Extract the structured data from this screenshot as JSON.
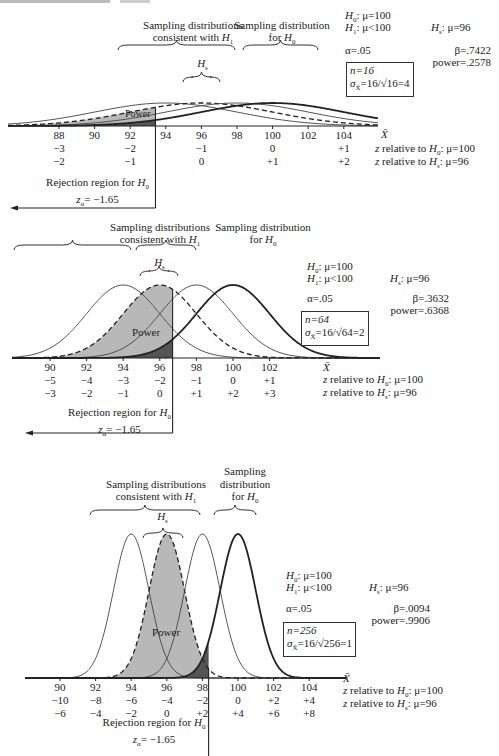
{
  "chart_data": [
    {
      "type": "line",
      "title": "Power for n=16",
      "xlabel": "X̄",
      "ylabel": "",
      "x_ticks": [
        88,
        90,
        92,
        94,
        96,
        98,
        100,
        102,
        104
      ],
      "z_rel_H0": {
        "label": "z relative to H0: μ=100",
        "ticks": {
          "88": "−3",
          "92": "−2",
          "96": "−1",
          "100": "0",
          "104": "+1"
        }
      },
      "z_rel_Hs": {
        "label": "z relative to Hs: μ=96",
        "ticks": {
          "88": "−2",
          "92": "−1",
          "96": "0",
          "100": "+1",
          "104": "+2"
        }
      },
      "series": [
        {
          "name": "H1 distribution",
          "mean": 94,
          "sd": 4,
          "style": "thin"
        },
        {
          "name": "Hs distribution",
          "mean": 96,
          "sd": 4,
          "style": "dashed"
        },
        {
          "name": "H1 distribution",
          "mean": 98,
          "sd": 4,
          "style": "thin"
        },
        {
          "name": "H0 distribution",
          "mean": 100,
          "sd": 4,
          "style": "thick"
        }
      ],
      "critical_value": 93.42,
      "annotations": [
        "Power",
        "Rejection region for H0",
        "zα = −1.65"
      ],
      "H0": "μ=100",
      "H1": "μ<100",
      "Hs": "μ=96",
      "alpha": ".05",
      "beta": ".7422",
      "power": ".2578",
      "n": "16",
      "sigma_xbar": "16/√16 = 4"
    },
    {
      "type": "line",
      "title": "Power for n=64",
      "xlabel": "X̄",
      "x_ticks": [
        90,
        92,
        94,
        96,
        98,
        100,
        102
      ],
      "z_rel_H0": {
        "label": "z relative to H0: μ=100",
        "ticks": [
          "−5",
          "−4",
          "−3",
          "−2",
          "−1",
          "0",
          "+1"
        ]
      },
      "z_rel_Hs": {
        "label": "z relative to Hs: μ=96",
        "ticks": [
          "−3",
          "−2",
          "−1",
          "0",
          "+1",
          "+2",
          "+3"
        ]
      },
      "series": [
        {
          "name": "H1 distribution",
          "mean": 94,
          "sd": 2,
          "style": "thin"
        },
        {
          "name": "Hs distribution",
          "mean": 96,
          "sd": 2,
          "style": "dashed"
        },
        {
          "name": "H1 distribution",
          "mean": 98,
          "sd": 2,
          "style": "thin"
        },
        {
          "name": "H0 distribution",
          "mean": 100,
          "sd": 2,
          "style": "thick"
        }
      ],
      "critical_value": 96.7,
      "annotations": [
        "Power",
        "α",
        "Rejection region for H0",
        "zα = −1.65"
      ],
      "H0": "μ=100",
      "H1": "μ<100",
      "Hs": "μ=96",
      "alpha": ".05",
      "beta": ".3632",
      "power": ".6368",
      "n": "64",
      "sigma_xbar": "16/√64 = 2"
    },
    {
      "type": "line",
      "title": "Power for n=256",
      "xlabel": "X̄",
      "x_ticks": [
        90,
        92,
        94,
        96,
        98,
        100,
        102,
        104
      ],
      "z_rel_H0": {
        "label": "z relative to H0: μ=100",
        "ticks": [
          "−10",
          "−8",
          "−6",
          "−4",
          "−2",
          "0",
          "+2",
          "+4"
        ]
      },
      "z_rel_Hs": {
        "label": "z relative to Hs: μ=96",
        "ticks": [
          "−6",
          "−4",
          "−2",
          "0",
          "+2",
          "+4",
          "+6",
          "+8"
        ]
      },
      "series": [
        {
          "name": "H1 distribution",
          "mean": 94,
          "sd": 1,
          "style": "thin"
        },
        {
          "name": "Hs distribution",
          "mean": 96,
          "sd": 1,
          "style": "dashed"
        },
        {
          "name": "H1 distribution",
          "mean": 98,
          "sd": 1,
          "style": "thin"
        },
        {
          "name": "H0 distribution",
          "mean": 100,
          "sd": 1,
          "style": "thick"
        }
      ],
      "critical_value": 98.35,
      "annotations": [
        "Power",
        "Rejection region for H0",
        "zα = −1.65"
      ],
      "H0": "μ=100",
      "H1": "μ<100",
      "Hs": "μ=96",
      "alpha": ".05",
      "beta": ".0094",
      "power": ".9906",
      "n": "256",
      "sigma_xbar": "16/√256 = 1"
    }
  ],
  "labels": {
    "consistent_h1_l1": "Sampling distributions",
    "consistent_h1_l2": "consistent with ",
    "h1_sym": "H",
    "h1_sub": "1",
    "for_h0_l1": "Sampling distribution",
    "for_h0_l2": "for ",
    "h0_sym": "H",
    "h0_sub": "0",
    "hs_sym": "H",
    "hs_sub": "s",
    "p3_sampling": "Sampling",
    "p3_distribution": "distribution",
    "power": "Power",
    "alpha_mark": "α",
    "xbar": "X̄",
    "rejection": "Rejection region for ",
    "z_alpha": "= −1.65",
    "z_sym": "z",
    "z_sub": "α",
    "z_rel_h0": "z relative to ",
    "z_rel_h0_tail": ": μ=100",
    "z_rel_hs_tail": ": μ=96"
  },
  "panels": [
    {
      "h0_line": ": μ=100",
      "h1_line": ": μ<100",
      "hs_line": ": μ=96",
      "alpha_line": "α=.05",
      "beta_line": "β=.7422",
      "power_line": "power=.2578",
      "n_line": "n=16",
      "sigma_line": "=16/√16=4",
      "ticks": [
        "88",
        "90",
        "92",
        "94",
        "96",
        "98",
        "100",
        "102",
        "104"
      ],
      "zh0": [
        "−3",
        "",
        "−2",
        "",
        "−1",
        "",
        "0",
        "",
        "+1"
      ],
      "zhs": [
        "−2",
        "",
        "−1",
        "",
        "0",
        "",
        "+1",
        "",
        "+2"
      ]
    },
    {
      "h0_line": ": μ=100",
      "h1_line": ": μ<100",
      "hs_line": ": μ=96",
      "alpha_line": "α=.05",
      "beta_line": "β=.3632",
      "power_line": "power=.6368",
      "n_line": "n=64",
      "sigma_line": "=16/√64=2",
      "ticks": [
        "90",
        "92",
        "94",
        "96",
        "98",
        "100",
        "102"
      ],
      "zh0": [
        "−5",
        "−4",
        "−3",
        "−2",
        "−1",
        "0",
        "+1"
      ],
      "zhs": [
        "−3",
        "−2",
        "−1",
        "0",
        "+1",
        "+2",
        "+3"
      ]
    },
    {
      "h0_line": ": μ=100",
      "h1_line": ": μ<100",
      "hs_line": ": μ=96",
      "alpha_line": "α=.05",
      "beta_line": "β=.0094",
      "power_line": "power=.9906",
      "n_line": "n=256",
      "sigma_line": "=16/√256=1",
      "ticks": [
        "90",
        "92",
        "94",
        "96",
        "98",
        "100",
        "102",
        "104"
      ],
      "zh0": [
        "−10",
        "−8",
        "−6",
        "−4",
        "−2",
        "0",
        "+2",
        "+4"
      ],
      "zhs": [
        "−6",
        "−4",
        "−2",
        "0",
        "+2",
        "+4",
        "+6",
        "+8"
      ]
    }
  ]
}
